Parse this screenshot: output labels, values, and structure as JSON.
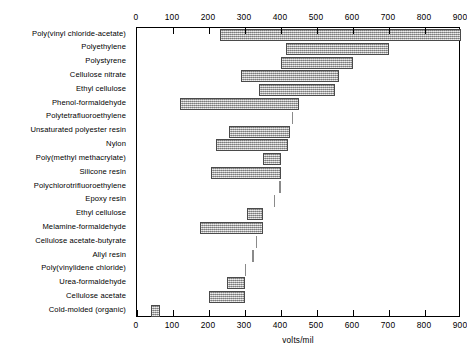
{
  "chart_data": {
    "type": "bar",
    "orientation": "horizontal",
    "title": "",
    "xlabel": "volts/mil",
    "ylabel": "",
    "xlim": [
      0,
      900
    ],
    "xticks": [
      0,
      100,
      200,
      300,
      400,
      500,
      600,
      700,
      800,
      900
    ],
    "xticklabels": [
      "0",
      "100",
      "200",
      "300",
      "400",
      "500",
      "600",
      "700",
      "800",
      "900"
    ],
    "axis_top": true,
    "axis_bottom": true,
    "grid": false,
    "legend": null,
    "bar_style": "range_bars",
    "categories": [
      "Poly(vinyl chloride-acetate)",
      "Polyethylene",
      "Polystyrene",
      "Cellulose nitrate",
      "Ethyl cellulose",
      "Phenol-formaldehyde",
      "Polytetrafluoroethylene",
      "Unsaturated  polyester resin",
      "Nylon",
      "Poly(methyl methacrylate)",
      "Silicone resin",
      "Polychlorotrifluoroethylene",
      "Epoxy resin",
      "Ethyl cellulose",
      "Melamine-formaldehyde",
      "Cellulose acetate-butyrate",
      "Allyl resin",
      "Poly(vinylidene chloride)",
      "Urea-formaldehyde",
      "Cellulose acetate",
      "Cold-molded (organic)"
    ],
    "ranges": [
      {
        "category": "Poly(vinyl chloride-acetate)",
        "low": 230,
        "high": 900
      },
      {
        "category": "Polyethylene",
        "low": 415,
        "high": 700
      },
      {
        "category": "Polystyrene",
        "low": 400,
        "high": 600
      },
      {
        "category": "Cellulose nitrate",
        "low": 290,
        "high": 560
      },
      {
        "category": "Ethyl cellulose",
        "low": 340,
        "high": 550
      },
      {
        "category": "Phenol-formaldehyde",
        "low": 120,
        "high": 450
      },
      {
        "category": "Polytetrafluoroethylene",
        "low": 430,
        "high": 430
      },
      {
        "category": "Unsaturated  polyester resin",
        "low": 255,
        "high": 425
      },
      {
        "category": "Nylon",
        "low": 220,
        "high": 420
      },
      {
        "category": "Poly(methyl methacrylate)",
        "low": 350,
        "high": 400
      },
      {
        "category": "Silicone resin",
        "low": 205,
        "high": 400
      },
      {
        "category": "Polychlorotrifluoroethylene",
        "low": 395,
        "high": 395
      },
      {
        "category": "Epoxy resin",
        "low": 380,
        "high": 380
      },
      {
        "category": "Ethyl cellulose",
        "low": 305,
        "high": 350
      },
      {
        "category": "Melamine-formaldehyde",
        "low": 175,
        "high": 350
      },
      {
        "category": "Cellulose acetate-butyrate",
        "low": 330,
        "high": 330
      },
      {
        "category": "Allyl resin",
        "low": 320,
        "high": 320
      },
      {
        "category": "Poly(vinylidene chloride)",
        "low": 300,
        "high": 300
      },
      {
        "category": "Urea-formaldehyde",
        "low": 250,
        "high": 300
      },
      {
        "category": "Cellulose acetate",
        "low": 200,
        "high": 300
      },
      {
        "category": "Cold-molded (organic)",
        "low": 40,
        "high": 65
      }
    ]
  }
}
